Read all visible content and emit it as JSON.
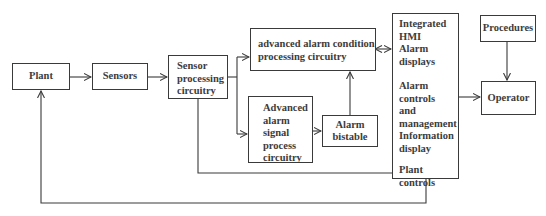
{
  "diagram": {
    "type": "block-flow",
    "nodes": {
      "plant": {
        "label": "Plant"
      },
      "sensors": {
        "label": "Sensors"
      },
      "sensor_processing": {
        "label": "Sensor\nprocessing\ncircuitry"
      },
      "adv_condition": {
        "label": "advanced alarm condition\nprocessing circuitry"
      },
      "adv_signal": {
        "label": "Advanced\nalarm\nsignal\nprocess\ncircuitry"
      },
      "alarm_bistable": {
        "label": "Alarm\nbistable"
      },
      "hmi": {
        "title": "Integrated HMI",
        "items": [
          "Alarm\ndisplays",
          "Alarm controls\nand\nmanagement",
          "Information\ndisplay",
          "Plant controls"
        ]
      },
      "procedures": {
        "label": "Procedures"
      },
      "operator": {
        "label": "Operator"
      }
    },
    "edges": [
      {
        "from": "plant",
        "to": "sensors",
        "type": "arrow"
      },
      {
        "from": "sensors",
        "to": "sensor_processing",
        "type": "arrow"
      },
      {
        "from": "sensor_processing",
        "to": "adv_condition",
        "type": "arrow"
      },
      {
        "from": "sensor_processing",
        "to": "adv_signal",
        "type": "arrow"
      },
      {
        "from": "adv_signal",
        "to": "alarm_bistable",
        "type": "arrow"
      },
      {
        "from": "alarm_bistable",
        "to": "adv_condition",
        "type": "arrow"
      },
      {
        "from": "adv_condition",
        "to": "hmi",
        "type": "bidirectional"
      },
      {
        "from": "sensor_processing",
        "to": "hmi",
        "type": "line"
      },
      {
        "from": "hmi",
        "to": "operator",
        "type": "arrow"
      },
      {
        "from": "procedures",
        "to": "operator",
        "type": "arrow"
      },
      {
        "from": "hmi",
        "to": "plant",
        "type": "arrow",
        "note": "plant controls feedback"
      }
    ],
    "colors": {
      "line": "#3a3a3a",
      "text": "#3c3c3c",
      "background": "#ffffff"
    }
  }
}
